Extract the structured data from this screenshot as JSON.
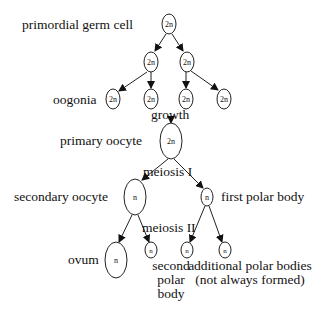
{
  "diagram": {
    "stage_labels": {
      "primordial": "primordial germ cell",
      "oogonia": "oogonia",
      "growth": "growth",
      "primary": "primary oocyte",
      "meiosis1": "meiosis I",
      "secondary": "secondary oocyte",
      "first_polar": "first polar body",
      "meiosis2": "meiosis II",
      "ovum": "ovum",
      "second_polar_1": "second",
      "second_polar_2": "polar",
      "second_polar_3": "body",
      "additional_1": "additional polar bodies",
      "additional_2": "(not always formed)"
    },
    "nodes": {
      "root": "2n",
      "l1a": "2n",
      "l1b": "2n",
      "l2a": "2n",
      "l2b": "2n",
      "l2c": "2n",
      "l2d": "2n",
      "primary": "2n",
      "secondary": "n",
      "first_polar": "n",
      "ovum": "n",
      "second_polar": "n",
      "add1": "n",
      "add2": "n"
    }
  }
}
